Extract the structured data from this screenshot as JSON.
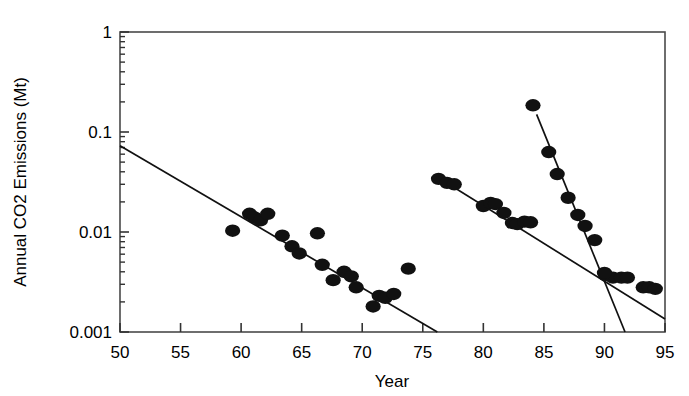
{
  "chart_data": {
    "type": "scatter",
    "title": "",
    "xlabel": "Year",
    "ylabel": "Annual CO2 Emissions  (Mt)",
    "yscale": "log",
    "xscale": "linear",
    "xlim": [
      50,
      95
    ],
    "ylim": [
      0.001,
      1
    ],
    "xticks": [
      50,
      55,
      60,
      65,
      70,
      75,
      80,
      85,
      90,
      95
    ],
    "xtick_labels": [
      "50",
      "55",
      "60",
      "65",
      "70",
      "75",
      "80",
      "85",
      "90",
      "95"
    ],
    "yticks": [
      0.001,
      0.01,
      0.1,
      1
    ],
    "ytick_labels": [
      "0.001",
      "0.01",
      "0.1",
      "1"
    ],
    "y_minor_ticks": true,
    "grid": false,
    "legend": null,
    "marker": "filled-circle",
    "marker_color": "#111111",
    "line_color": "#111111",
    "frame_color": "#4a4a4a",
    "series": [
      {
        "name": "cluster-1",
        "points": [
          {
            "x": 59.3,
            "y": 0.0103
          },
          {
            "x": 60.7,
            "y": 0.0152
          },
          {
            "x": 61.1,
            "y": 0.014
          },
          {
            "x": 61.6,
            "y": 0.0131
          },
          {
            "x": 62.2,
            "y": 0.0152
          },
          {
            "x": 63.4,
            "y": 0.0092
          },
          {
            "x": 64.2,
            "y": 0.0072
          },
          {
            "x": 64.8,
            "y": 0.0061
          },
          {
            "x": 66.3,
            "y": 0.0097
          },
          {
            "x": 66.7,
            "y": 0.0047
          },
          {
            "x": 67.6,
            "y": 0.0033
          },
          {
            "x": 68.5,
            "y": 0.004
          },
          {
            "x": 69.1,
            "y": 0.0036
          },
          {
            "x": 69.5,
            "y": 0.0028
          },
          {
            "x": 70.9,
            "y": 0.0018
          },
          {
            "x": 71.4,
            "y": 0.0023
          },
          {
            "x": 71.9,
            "y": 0.0022
          },
          {
            "x": 72.6,
            "y": 0.0024
          },
          {
            "x": 73.8,
            "y": 0.0043
          }
        ]
      },
      {
        "name": "cluster-2",
        "points": [
          {
            "x": 76.3,
            "y": 0.034
          },
          {
            "x": 77.0,
            "y": 0.031
          },
          {
            "x": 77.6,
            "y": 0.03
          },
          {
            "x": 80.0,
            "y": 0.0182
          },
          {
            "x": 80.6,
            "y": 0.0195
          },
          {
            "x": 81.0,
            "y": 0.019
          },
          {
            "x": 81.7,
            "y": 0.0155
          },
          {
            "x": 82.4,
            "y": 0.0123
          },
          {
            "x": 82.8,
            "y": 0.012
          },
          {
            "x": 83.4,
            "y": 0.0127
          },
          {
            "x": 83.9,
            "y": 0.0125
          },
          {
            "x": 90.1,
            "y": 0.0037
          },
          {
            "x": 90.7,
            "y": 0.0035
          },
          {
            "x": 91.4,
            "y": 0.0035
          },
          {
            "x": 91.9,
            "y": 0.0035
          },
          {
            "x": 93.2,
            "y": 0.0028
          },
          {
            "x": 93.7,
            "y": 0.0028
          },
          {
            "x": 94.2,
            "y": 0.0027
          }
        ]
      },
      {
        "name": "cluster-3",
        "points": [
          {
            "x": 84.1,
            "y": 0.185
          },
          {
            "x": 85.4,
            "y": 0.063
          },
          {
            "x": 86.1,
            "y": 0.038
          },
          {
            "x": 87.0,
            "y": 0.022
          },
          {
            "x": 87.8,
            "y": 0.0148
          },
          {
            "x": 88.4,
            "y": 0.0115
          },
          {
            "x": 89.2,
            "y": 0.0083
          },
          {
            "x": 90.0,
            "y": 0.0039
          }
        ]
      }
    ],
    "fit_lines": [
      {
        "name": "fit-line-1",
        "x1": 50.0,
        "y1": 0.073,
        "x2": 76.2,
        "y2": 0.001
      },
      {
        "name": "fit-line-2",
        "x1": 76.2,
        "y1": 0.0355,
        "x2": 95.0,
        "y2": 0.00135
      },
      {
        "name": "fit-line-3",
        "x1": 84.4,
        "y1": 0.15,
        "x2": 91.7,
        "y2": 0.001
      }
    ]
  },
  "axes": {
    "ylabel": "Annual CO2 Emissions  (Mt)",
    "xlabel": "Year",
    "xtick_labels": [
      "50",
      "55",
      "60",
      "65",
      "70",
      "75",
      "80",
      "85",
      "90",
      "95"
    ],
    "ytick_labels": [
      "1",
      "0.1",
      "0.01",
      "0.001"
    ]
  }
}
